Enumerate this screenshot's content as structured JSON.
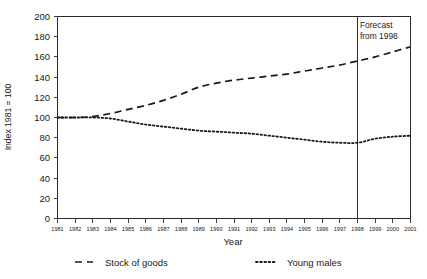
{
  "chart_data": {
    "type": "line",
    "title": "",
    "xlabel": "Year",
    "ylabel": "Index 1981 = 100",
    "xlim": [
      1981,
      2001
    ],
    "ylim": [
      0,
      200
    ],
    "grid": false,
    "legend_position": "bottom",
    "x": [
      1981,
      1982,
      1983,
      1984,
      1985,
      1986,
      1987,
      1988,
      1989,
      1990,
      1991,
      1992,
      1993,
      1994,
      1995,
      1996,
      1997,
      1998,
      1999,
      2000,
      2001
    ],
    "xticklabels": [
      "1981",
      "1982",
      "1983",
      "1984",
      "1985",
      "1986",
      "1987",
      "1988",
      "1989",
      "1990",
      "1991",
      "1992",
      "1993",
      "1994",
      "1995",
      "1996",
      "1997",
      "1998",
      "1999",
      "2000",
      "2001"
    ],
    "yticks": [
      0,
      20,
      40,
      60,
      80,
      100,
      120,
      140,
      160,
      180,
      200
    ],
    "yticklabels": [
      "0",
      "20",
      "40",
      "60",
      "80",
      "100",
      "120",
      "140",
      "160",
      "180",
      "200"
    ],
    "series": [
      {
        "name": "Stock of goods",
        "style": "dashed",
        "color": "#1a1a1a",
        "values": [
          100,
          100,
          101,
          104,
          108,
          112,
          117,
          123,
          130,
          134,
          137,
          139,
          141,
          143,
          146,
          149,
          152,
          156,
          160,
          165,
          170
        ]
      },
      {
        "name": "Young males",
        "style": "dotted",
        "color": "#1a1a1a",
        "values": [
          100,
          100,
          100,
          99,
          96,
          93,
          91,
          89,
          87,
          86,
          85,
          84,
          82,
          80,
          78,
          76,
          75,
          75,
          79,
          81,
          82
        ]
      }
    ],
    "annotations": [
      {
        "name": "forecast-divider",
        "type": "vline",
        "x": 1998,
        "label_line1": "Forecast",
        "label_line2": "from 1998"
      }
    ],
    "legend": [
      {
        "label": "Stock of goods",
        "style": "dashed"
      },
      {
        "label": "Young males",
        "style": "dotted"
      }
    ]
  }
}
